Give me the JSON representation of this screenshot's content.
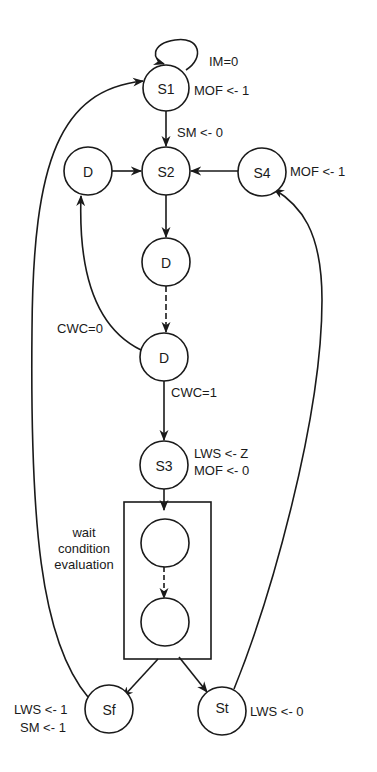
{
  "diagram": {
    "type": "state-machine",
    "nodes": [
      {
        "id": "S1",
        "label": "S1",
        "annotation": "MOF <- 1"
      },
      {
        "id": "S2",
        "label": "S2",
        "annotation": ""
      },
      {
        "id": "D_left",
        "label": "D",
        "annotation": ""
      },
      {
        "id": "S4",
        "label": "S4",
        "annotation": "MOF <- 1"
      },
      {
        "id": "D_mid",
        "label": "D",
        "annotation": ""
      },
      {
        "id": "D_lower",
        "label": "D",
        "annotation": ""
      },
      {
        "id": "S3",
        "label": "S3",
        "annotation_lines": [
          "LWS <- Z",
          "MOF <- 0"
        ]
      },
      {
        "id": "W1",
        "label": "",
        "annotation": ""
      },
      {
        "id": "W2",
        "label": "",
        "annotation": ""
      },
      {
        "id": "Sf",
        "label": "Sf",
        "annotation_lines": [
          "LWS <- 1",
          "SM <- 1"
        ]
      },
      {
        "id": "St",
        "label": "St",
        "annotation": "LWS <- 0"
      }
    ],
    "edges": [
      {
        "from": "S1",
        "to": "S1",
        "label": "IM=0",
        "style": "self-loop"
      },
      {
        "from": "S1",
        "to": "S2",
        "label": "SM <- 0"
      },
      {
        "from": "D_left",
        "to": "S2",
        "label": ""
      },
      {
        "from": "S4",
        "to": "S2",
        "label": ""
      },
      {
        "from": "S2",
        "to": "D_mid",
        "label": ""
      },
      {
        "from": "D_mid",
        "to": "D_lower",
        "label": "",
        "style": "dashed"
      },
      {
        "from": "D_lower",
        "to": "D_left",
        "label": "CWC=0"
      },
      {
        "from": "D_lower",
        "to": "S3",
        "label": "CWC=1"
      },
      {
        "from": "S3",
        "to": "wait_box",
        "label": ""
      },
      {
        "from": "W1",
        "to": "W2",
        "label": "",
        "style": "dashed"
      },
      {
        "from": "wait_box",
        "to": "Sf",
        "label": ""
      },
      {
        "from": "wait_box",
        "to": "St",
        "label": ""
      },
      {
        "from": "Sf",
        "to": "S1",
        "label": ""
      },
      {
        "from": "St",
        "to": "S4",
        "label": ""
      }
    ],
    "group": {
      "id": "wait_box",
      "label_lines": [
        "wait",
        "condition",
        "evaluation"
      ]
    }
  }
}
